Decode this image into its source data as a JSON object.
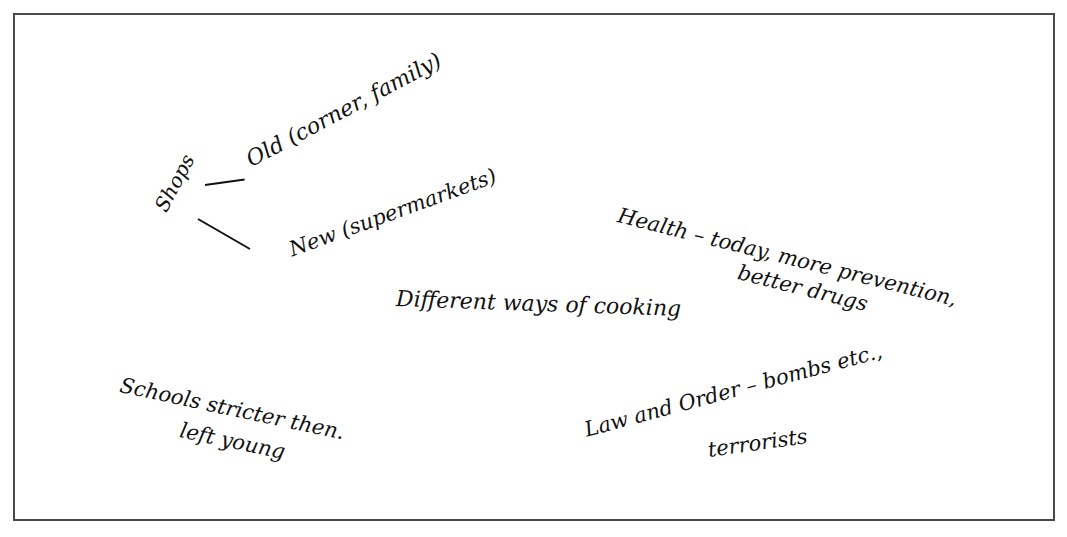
{
  "notes": {
    "shops": "Shops",
    "old": "Old (corner, family)",
    "new": "New (supermarkets)",
    "health_1": "Health – today, more prevention,",
    "health_2": "better drugs",
    "cooking": "Different ways of cooking",
    "schools_1": "Schools stricter then.",
    "schools_2": "left young",
    "law_1": "Law and Order – bombs etc.,",
    "law_2": "terrorists"
  },
  "colors": {
    "ink": "#111111",
    "border": "#4a4a4a",
    "paper": "#ffffff"
  }
}
